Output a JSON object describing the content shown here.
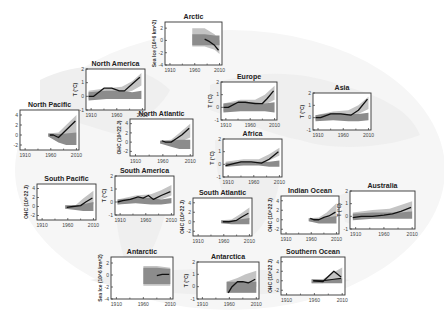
{
  "figure": {
    "background": "faint grey world map",
    "colors": {
      "observed": "#111111",
      "natural_band": "#8c8c8c",
      "all_forcing_band": "#c4c4c4",
      "frame": "#333333"
    }
  },
  "chart_data": [
    {
      "type": "line",
      "title": "Arctic",
      "ylabel": "Sea Ice (10^6 km^2)",
      "xticks": [
        "1910",
        "1960",
        "2010"
      ],
      "yticks": [
        -4,
        -2,
        0,
        2
      ],
      "ylim": [
        -4,
        3
      ],
      "xlim": [
        1900,
        2015
      ],
      "box": [
        165,
        22,
        57,
        43
      ],
      "observed": {
        "x": [
          1980,
          1990,
          2000,
          2008
        ],
        "y": [
          0.2,
          -0.2,
          -0.8,
          -1.6
        ]
      },
      "all_band": {
        "x": [
          1955,
          1980,
          2000,
          2010
        ],
        "lo": [
          -1.0,
          -1.0,
          -1.5,
          -2.2
        ],
        "hi": [
          2.0,
          2.0,
          1.0,
          0.0
        ]
      },
      "nat_band": {
        "x": [
          1955,
          1980,
          2000,
          2010
        ],
        "lo": [
          -0.8,
          -0.8,
          -0.8,
          -0.8
        ],
        "hi": [
          1.0,
          1.0,
          0.8,
          0.8
        ]
      }
    },
    {
      "type": "line",
      "title": "North America",
      "ylabel": "T (°C)",
      "xticks": [
        "1910",
        "1960",
        "2010"
      ],
      "yticks": [
        -1,
        0,
        1,
        2
      ],
      "ylim": [
        -1,
        2
      ],
      "xlim": [
        1900,
        2015
      ],
      "box": [
        86,
        69,
        59,
        41
      ],
      "observed": {
        "x": [
          1905,
          1915,
          1935,
          1950,
          1965,
          1975,
          1990,
          2005
        ],
        "y": [
          0.0,
          0.0,
          0.6,
          0.6,
          0.4,
          0.4,
          0.9,
          1.4
        ]
      },
      "all_band": {
        "x": [
          1905,
          1940,
          1970,
          1990,
          2008
        ],
        "lo": [
          -0.2,
          0.0,
          0.2,
          0.4,
          0.8
        ],
        "hi": [
          0.4,
          0.6,
          0.7,
          1.1,
          1.7
        ]
      },
      "nat_band": {
        "x": [
          1905,
          1940,
          1970,
          1990,
          2008
        ],
        "lo": [
          -0.3,
          -0.2,
          -0.2,
          -0.2,
          -0.2
        ],
        "hi": [
          0.3,
          0.4,
          0.4,
          0.3,
          0.4
        ]
      }
    },
    {
      "type": "line",
      "title": "North Pacific",
      "ylabel": "",
      "xticks": [
        "1910",
        "1960",
        "2010"
      ],
      "yticks": [
        -2,
        0,
        2,
        4
      ],
      "ylim": [
        -3,
        5
      ],
      "xlim": [
        1900,
        2015
      ],
      "box": [
        20,
        110,
        59,
        40
      ],
      "observed": {
        "x": [
          1958,
          1965,
          1975,
          1985,
          1995,
          2008
        ],
        "y": [
          0,
          0,
          -0.5,
          0.5,
          1.5,
          2.8
        ]
      },
      "all_band": {
        "x": [
          1955,
          1975,
          1990,
          2010
        ],
        "lo": [
          -0.3,
          -1.0,
          -0.5,
          0.5
        ],
        "hi": [
          0.3,
          0.5,
          2.0,
          4.0
        ]
      },
      "nat_band": {
        "x": [
          1955,
          1975,
          1990,
          2010
        ],
        "lo": [
          -0.3,
          -1.5,
          -2.0,
          -2.0
        ],
        "hi": [
          0.3,
          0.2,
          0.3,
          0.5
        ]
      }
    },
    {
      "type": "line",
      "title": "North Atlantic",
      "ylabel": "OHC (10^22 J)",
      "xticks": [
        "1910",
        "1960",
        "2010"
      ],
      "yticks": [
        -2,
        0,
        2,
        4
      ],
      "ylim": [
        -3,
        5
      ],
      "xlim": [
        1900,
        2015
      ],
      "box": [
        130,
        119,
        63,
        37
      ],
      "observed": {
        "x": [
          1958,
          1965,
          1975,
          1985,
          1995,
          2008
        ],
        "y": [
          0.3,
          0.0,
          0.0,
          0.8,
          1.6,
          3.0
        ]
      },
      "all_band": {
        "x": [
          1955,
          1975,
          1990,
          2010
        ],
        "lo": [
          -0.3,
          -0.5,
          0.0,
          1.0
        ],
        "hi": [
          0.3,
          0.5,
          2.0,
          4.0
        ]
      },
      "nat_band": {
        "x": [
          1955,
          1975,
          1990,
          2010
        ],
        "lo": [
          -0.3,
          -1.0,
          -1.5,
          -1.5
        ],
        "hi": [
          0.3,
          0.3,
          0.5,
          0.5
        ]
      }
    },
    {
      "type": "line",
      "title": "Europe",
      "ylabel": "T (°C)",
      "xticks": [
        "1910",
        "1960",
        "2010"
      ],
      "yticks": [
        -1,
        0,
        1,
        2
      ],
      "ylim": [
        -1,
        2
      ],
      "xlim": [
        1900,
        2015
      ],
      "box": [
        221,
        82,
        56,
        38
      ],
      "observed": {
        "x": [
          1905,
          1915,
          1935,
          1950,
          1970,
          1985,
          1995,
          2008
        ],
        "y": [
          0.0,
          0.0,
          0.4,
          0.4,
          0.3,
          0.3,
          0.7,
          1.3
        ]
      },
      "all_band": {
        "x": [
          1905,
          1940,
          1970,
          1990,
          2010
        ],
        "lo": [
          -0.3,
          -0.1,
          0.0,
          0.2,
          0.6
        ],
        "hi": [
          0.3,
          0.6,
          0.6,
          1.0,
          1.7
        ]
      },
      "nat_band": {
        "x": [
          1905,
          1940,
          1970,
          1990,
          2010
        ],
        "lo": [
          -0.4,
          -0.3,
          -0.3,
          -0.3,
          -0.4
        ],
        "hi": [
          0.3,
          0.4,
          0.4,
          0.3,
          0.4
        ]
      }
    },
    {
      "type": "line",
      "title": "Asia",
      "ylabel": "T (°C)",
      "xticks": [
        "1910",
        "1960",
        "2010"
      ],
      "yticks": [
        -1,
        0,
        1,
        2
      ],
      "ylim": [
        -1,
        2
      ],
      "xlim": [
        1900,
        2015
      ],
      "box": [
        313,
        93,
        58,
        37
      ],
      "observed": {
        "x": [
          1905,
          1915,
          1935,
          1955,
          1975,
          1990,
          2008
        ],
        "y": [
          0.0,
          0.0,
          0.3,
          0.3,
          0.2,
          0.6,
          1.5
        ]
      },
      "all_band": {
        "x": [
          1905,
          1940,
          1970,
          1990,
          2010
        ],
        "lo": [
          -0.2,
          0.0,
          0.1,
          0.3,
          0.7
        ],
        "hi": [
          0.2,
          0.5,
          0.6,
          1.0,
          1.7
        ]
      },
      "nat_band": {
        "x": [
          1905,
          1940,
          1970,
          1990,
          2010
        ],
        "lo": [
          -0.3,
          -0.2,
          -0.3,
          -0.3,
          -0.2
        ],
        "hi": [
          0.2,
          0.4,
          0.3,
          0.3,
          0.4
        ]
      }
    },
    {
      "type": "line",
      "title": "Africa",
      "ylabel": "T (°C)",
      "xticks": [
        "1910",
        "1960",
        "2010"
      ],
      "yticks": [
        -1,
        0,
        1,
        2
      ],
      "ylim": [
        -1,
        2
      ],
      "xlim": [
        1900,
        2015
      ],
      "box": [
        223,
        139,
        59,
        38
      ],
      "observed": {
        "x": [
          1905,
          1915,
          1935,
          1955,
          1975,
          1990,
          2008
        ],
        "y": [
          -0.1,
          0.0,
          0.2,
          0.2,
          0.1,
          0.4,
          1.0
        ]
      },
      "all_band": {
        "x": [
          1905,
          1940,
          1970,
          1990,
          2010
        ],
        "lo": [
          -0.2,
          0.0,
          0.0,
          0.3,
          0.7
        ],
        "hi": [
          0.2,
          0.4,
          0.4,
          0.8,
          1.3
        ]
      },
      "nat_band": {
        "x": [
          1905,
          1940,
          1970,
          1990,
          2010
        ],
        "lo": [
          -0.2,
          -0.1,
          -0.1,
          -0.2,
          -0.2
        ],
        "hi": [
          0.1,
          0.2,
          0.2,
          0.2,
          0.3
        ]
      }
    },
    {
      "type": "line",
      "title": "South Pacific",
      "ylabel": "OHC (10^22 J)",
      "xticks": [
        "1910",
        "1960",
        "2010"
      ],
      "yticks": [
        -2,
        0,
        2,
        4
      ],
      "ylim": [
        -3,
        5
      ],
      "xlim": [
        1900,
        2015
      ],
      "box": [
        37,
        184,
        59,
        36
      ],
      "observed": {
        "x": [
          1958,
          1970,
          1985,
          1995,
          2008
        ],
        "y": [
          -0.2,
          0.0,
          0.2,
          1.0,
          1.9
        ]
      },
      "all_band": {
        "x": [
          1955,
          1975,
          1990,
          2010
        ],
        "lo": [
          -0.5,
          -0.5,
          0.0,
          0.5
        ],
        "hi": [
          0.3,
          0.3,
          1.8,
          3.5
        ]
      },
      "nat_band": {
        "x": [
          1955,
          1975,
          1990,
          2010
        ],
        "lo": [
          -0.5,
          -0.8,
          -1.0,
          -1.0
        ],
        "hi": [
          0.3,
          0.2,
          0.5,
          1.0
        ]
      }
    },
    {
      "type": "line",
      "title": "South America",
      "ylabel": "T (°C)",
      "xticks": [
        "1910",
        "1960",
        "2010"
      ],
      "yticks": [
        -1,
        0,
        1,
        2
      ],
      "ylim": [
        -1,
        2
      ],
      "xlim": [
        1900,
        2015
      ],
      "box": [
        115,
        176,
        59,
        39
      ],
      "observed": {
        "x": [
          1905,
          1915,
          1930,
          1945,
          1955,
          1965,
          1975,
          1990,
          2008
        ],
        "y": [
          0.0,
          0.1,
          0.2,
          0.4,
          0.3,
          0.5,
          0.2,
          0.5,
          0.8
        ]
      },
      "all_band": {
        "x": [
          1905,
          1940,
          1970,
          1990,
          2010
        ],
        "lo": [
          -0.2,
          0.0,
          0.1,
          0.2,
          0.5
        ],
        "hi": [
          0.2,
          0.5,
          0.6,
          0.9,
          1.3
        ]
      },
      "nat_band": {
        "x": [
          1905,
          1940,
          1970,
          1990,
          2010
        ],
        "lo": [
          -0.2,
          -0.1,
          -0.2,
          -0.2,
          -0.1
        ],
        "hi": [
          0.2,
          0.3,
          0.3,
          0.2,
          0.3
        ]
      }
    },
    {
      "type": "line",
      "title": "South Atlantic",
      "ylabel": "OHC (10^22 J)",
      "xticks": [
        "1910",
        "1960",
        "2010"
      ],
      "yticks": [
        -2,
        0,
        2,
        4
      ],
      "ylim": [
        -3,
        5
      ],
      "xlim": [
        1900,
        2015
      ],
      "box": [
        193,
        198,
        59,
        38
      ],
      "observed": {
        "x": [
          1958,
          1970,
          1985,
          1995,
          2008
        ],
        "y": [
          0.0,
          0.0,
          0.3,
          1.0,
          1.8
        ]
      },
      "all_band": {
        "x": [
          1955,
          1975,
          1990,
          2010
        ],
        "lo": [
          -0.3,
          -0.3,
          0.0,
          0.5
        ],
        "hi": [
          0.3,
          0.5,
          1.5,
          3.0
        ]
      },
      "nat_band": {
        "x": [
          1955,
          1975,
          1990,
          2010
        ],
        "lo": [
          -0.3,
          -0.5,
          -0.5,
          -0.5
        ],
        "hi": [
          0.3,
          0.2,
          0.5,
          0.8
        ]
      }
    },
    {
      "type": "line",
      "title": "Indian Ocean",
      "ylabel": "OHC (10^22 J)",
      "xticks": [
        "1910",
        "1960",
        "2010"
      ],
      "yticks": [
        -2,
        0,
        2,
        4
      ],
      "ylim": [
        -3,
        5
      ],
      "xlim": [
        1900,
        2015
      ],
      "box": [
        281,
        196,
        58,
        38
      ],
      "observed": {
        "x": [
          1958,
          1965,
          1975,
          1985,
          1995,
          2008
        ],
        "y": [
          0.3,
          0.0,
          0.0,
          0.5,
          0.8,
          1.6
        ]
      },
      "all_band": {
        "x": [
          1955,
          1975,
          1990,
          2010
        ],
        "lo": [
          -0.3,
          -0.5,
          0.0,
          0.5
        ],
        "hi": [
          0.3,
          0.5,
          1.5,
          3.5
        ]
      },
      "nat_band": {
        "x": [
          1955,
          1975,
          1990,
          2010
        ],
        "lo": [
          -0.3,
          -0.8,
          -0.8,
          -0.8
        ],
        "hi": [
          0.3,
          0.2,
          0.5,
          0.8
        ]
      }
    },
    {
      "type": "line",
      "title": "Australia",
      "ylabel": "T (°C)",
      "xticks": [
        "1910",
        "1960",
        "2010"
      ],
      "yticks": [
        -1,
        0,
        1,
        2
      ],
      "ylim": [
        -1,
        2
      ],
      "xlim": [
        1900,
        2015
      ],
      "box": [
        350,
        191,
        65,
        38
      ],
      "observed": {
        "x": [
          1905,
          1920,
          1940,
          1960,
          1975,
          1990,
          2008
        ],
        "y": [
          -0.1,
          0.0,
          0.0,
          0.1,
          0.2,
          0.4,
          0.7
        ]
      },
      "all_band": {
        "x": [
          1905,
          1940,
          1970,
          1990,
          2010
        ],
        "lo": [
          -0.2,
          -0.1,
          0.0,
          0.2,
          0.4
        ],
        "hi": [
          0.3,
          0.5,
          0.6,
          0.9,
          1.2
        ]
      },
      "nat_band": {
        "x": [
          1905,
          1940,
          1970,
          1990,
          2010
        ],
        "lo": [
          -0.3,
          -0.2,
          -0.2,
          -0.2,
          -0.2
        ],
        "hi": [
          0.2,
          0.3,
          0.3,
          0.3,
          0.4
        ]
      }
    },
    {
      "type": "line",
      "title": "Antarctic",
      "ylabel": "Sea Ice (10^6 km^2)",
      "xticks": [
        "1910",
        "1960",
        "2010"
      ],
      "yticks": [
        -4,
        -2,
        0,
        2
      ],
      "ylim": [
        -4,
        3
      ],
      "xlim": [
        1900,
        2015
      ],
      "box": [
        111,
        257,
        62,
        42
      ],
      "observed": {
        "x": [
          1985,
          1995,
          2008
        ],
        "y": [
          -0.1,
          0.1,
          0.1
        ]
      },
      "all_band": {
        "x": [
          1960,
          1985,
          2010
        ],
        "lo": [
          -1.8,
          -1.8,
          -1.8
        ],
        "hi": [
          1.5,
          1.5,
          1.2
        ]
      },
      "nat_band": {
        "x": [
          1960,
          1985,
          2010
        ],
        "lo": [
          -1.5,
          -1.5,
          -1.5
        ],
        "hi": [
          1.2,
          1.2,
          1.0
        ]
      }
    },
    {
      "type": "line",
      "title": "Antarctica",
      "ylabel": "T (°C)",
      "xticks": [
        "1910",
        "1960",
        "2010"
      ],
      "yticks": [
        -1,
        0,
        1,
        2
      ],
      "ylim": [
        -1,
        2
      ],
      "xlim": [
        1900,
        2015
      ],
      "box": [
        197,
        262,
        62,
        37
      ],
      "observed": {
        "x": [
          1958,
          1965,
          1975,
          1985,
          1995,
          2008
        ],
        "y": [
          -0.5,
          0.0,
          0.4,
          0.4,
          0.3,
          0.6
        ]
      },
      "all_band": {
        "x": [
          1955,
          1975,
          1990,
          2010
        ],
        "lo": [
          -0.4,
          -0.3,
          -0.2,
          0.0
        ],
        "hi": [
          0.4,
          0.7,
          1.0,
          1.3
        ]
      },
      "nat_band": {
        "x": [
          1955,
          1975,
          1990,
          2010
        ],
        "lo": [
          -0.5,
          -0.5,
          -0.5,
          -0.5
        ],
        "hi": [
          0.4,
          0.4,
          0.4,
          0.4
        ]
      }
    },
    {
      "type": "line",
      "title": "Southern Ocean",
      "ylabel": "OHC (10^22 J)",
      "xticks": [
        "1910",
        "1960",
        "2010"
      ],
      "yticks": [
        -2,
        0,
        2,
        4
      ],
      "ylim": [
        -3,
        5
      ],
      "xlim": [
        1900,
        2015
      ],
      "box": [
        281,
        257,
        64,
        38
      ],
      "observed": {
        "x": [
          1958,
          1975,
          1995,
          2008
        ],
        "y": [
          0.0,
          -0.2,
          2.0,
          0.8
        ]
      },
      "observed2": {
        "x": [
          1958,
          1975,
          1995,
          2008
        ],
        "y": [
          0.0,
          0.0,
          0.3,
          0.5
        ]
      },
      "all_band": {
        "x": [
          1955,
          1975,
          1990,
          2010
        ],
        "lo": [
          -0.5,
          -0.5,
          0.0,
          0.2
        ],
        "hi": [
          0.3,
          0.3,
          1.5,
          2.8
        ]
      },
      "nat_band": {
        "x": [
          1955,
          1975,
          1990,
          2010
        ],
        "lo": [
          -0.5,
          -0.5,
          -0.5,
          -0.5
        ],
        "hi": [
          0.3,
          0.2,
          0.3,
          0.5
        ]
      }
    }
  ]
}
